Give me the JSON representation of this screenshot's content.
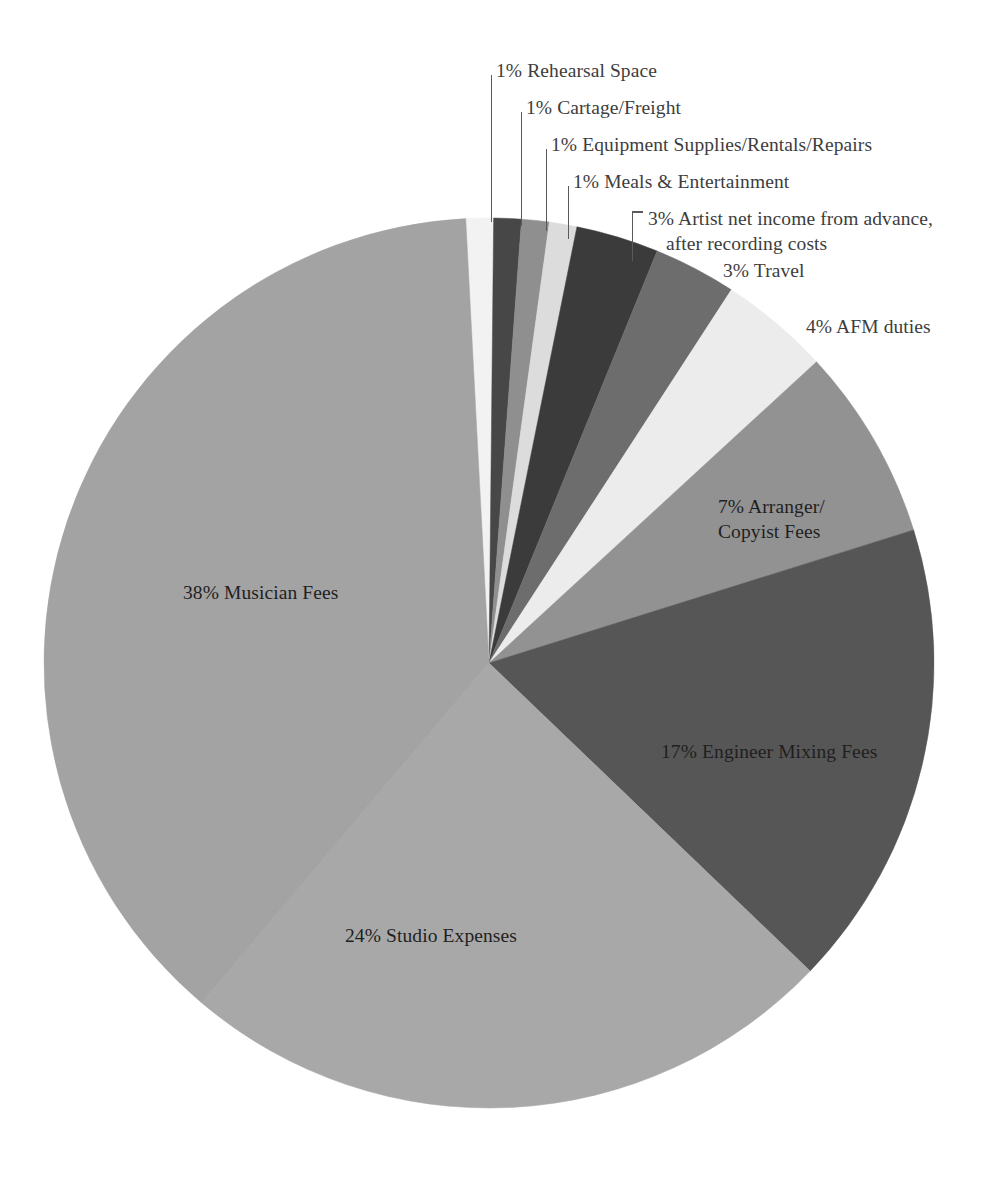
{
  "chart_data": {
    "type": "pie",
    "title": "",
    "subtitle": "",
    "xlabel": "",
    "ylabel": "",
    "legend_position": "none",
    "grid": false,
    "units": "percent",
    "total": 100,
    "start_angle_deg": -3,
    "direction": "clockwise",
    "center": {
      "x": 489,
      "y": 663
    },
    "radius": 445,
    "categories": [
      "Rehearsal Space",
      "Cartage/Freight",
      "Equipment Supplies/Rentals/Repairs",
      "Meals & Entertainment",
      "Artist net income from advance, after recording costs",
      "Travel",
      "AFM duties",
      "Arranger/Copyist Fees",
      "Engineer Mixing Fees",
      "Studio Expenses",
      "Musician Fees"
    ],
    "values": [
      1,
      1,
      1,
      1,
      3,
      3,
      4,
      7,
      17,
      24,
      38
    ],
    "colors": [
      "#f2f2f2",
      "#474747",
      "#8f8f8f",
      "#dcdcdc",
      "#3b3b3b",
      "#6d6d6d",
      "#ececec",
      "#929292",
      "#565656",
      "#a8a8a8",
      "#a3a3a3"
    ],
    "slices": [
      {
        "label": "Rehearsal Space",
        "value": 1,
        "display": "1% Rehearsal Space",
        "percent_text": "1%",
        "color": "#f2f2f2",
        "label_placement": "leader-outside"
      },
      {
        "label": "Cartage/Freight",
        "value": 1,
        "display": "1% Cartage/Freight",
        "percent_text": "1%",
        "color": "#474747",
        "label_placement": "leader-outside"
      },
      {
        "label": "Equipment Supplies/Rentals/Repairs",
        "value": 1,
        "display": "1% Equipment Supplies/Rentals/Repairs",
        "percent_text": "1%",
        "color": "#8f8f8f",
        "label_placement": "leader-outside"
      },
      {
        "label": "Meals & Entertainment",
        "value": 1,
        "display": "1% Meals & Entertainment",
        "percent_text": "1%",
        "color": "#dcdcdc",
        "label_placement": "leader-outside"
      },
      {
        "label": "Artist net income from advance, after recording costs",
        "value": 3,
        "display_line1": "3% Artist net income from advance,",
        "display_line2": "after recording costs",
        "percent_text": "3%",
        "color": "#3b3b3b",
        "label_placement": "leader-outside"
      },
      {
        "label": "Travel",
        "value": 3,
        "display": "3% Travel",
        "percent_text": "3%",
        "color": "#6d6d6d",
        "label_placement": "outside"
      },
      {
        "label": "AFM duties",
        "value": 4,
        "display": "4% AFM duties",
        "percent_text": "4%",
        "color": "#ececec",
        "label_placement": "outside"
      },
      {
        "label": "Arranger/Copyist Fees",
        "value": 7,
        "display_line1": "7% Arranger/",
        "display_line2": "Copyist Fees",
        "percent_text": "7%",
        "color": "#929292",
        "label_placement": "inside"
      },
      {
        "label": "Engineer Mixing Fees",
        "value": 17,
        "display": "17% Engineer Mixing Fees",
        "percent_text": "17%",
        "color": "#565656",
        "label_placement": "inside"
      },
      {
        "label": "Studio Expenses",
        "value": 24,
        "display": "24% Studio Expenses",
        "percent_text": "24%",
        "color": "#a8a8a8",
        "label_placement": "inside"
      },
      {
        "label": "Musician Fees",
        "value": 38,
        "display": "38% Musician Fees",
        "percent_text": "38%",
        "color": "#a3a3a3",
        "label_placement": "inside"
      }
    ]
  },
  "labels": {
    "rehearsal": "1% Rehearsal Space",
    "cartage": "1% Cartage/Freight",
    "equipment": "1% Equipment Supplies/Rentals/Repairs",
    "meals": "1% Meals & Entertainment",
    "artist_line1": "3% Artist net income from advance,",
    "artist_line2": "after recording costs",
    "travel": "3% Travel",
    "afm": "4% AFM duties",
    "arranger_line1": "7% Arranger/",
    "arranger_line2": "Copyist Fees",
    "engineer": "17% Engineer Mixing Fees",
    "studio": "24% Studio Expenses",
    "musician": "38% Musician Fees"
  }
}
